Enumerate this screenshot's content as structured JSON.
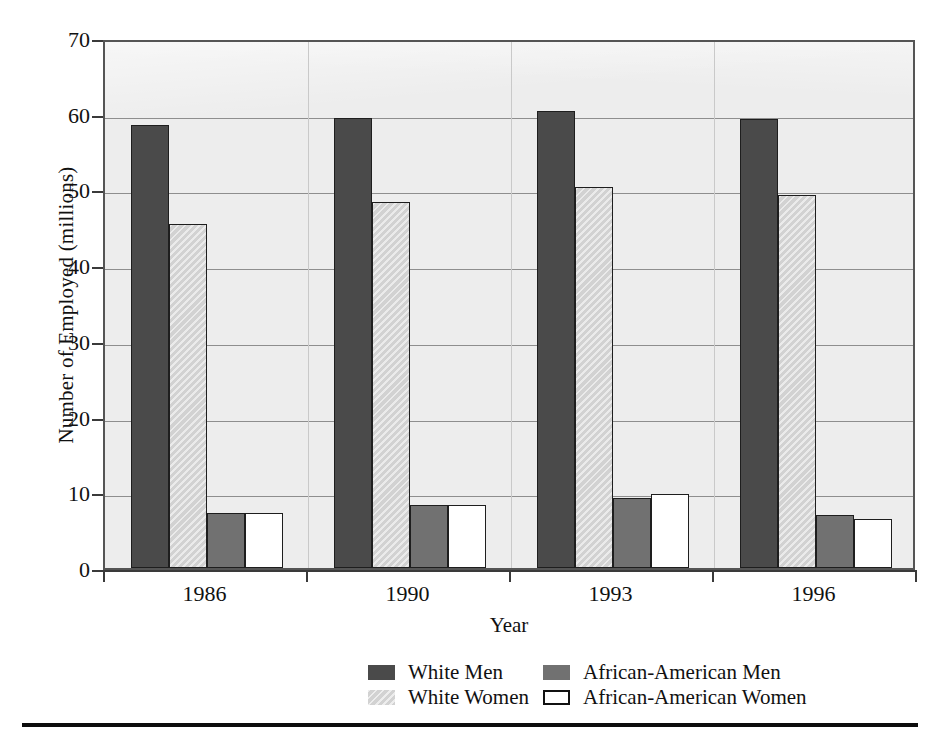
{
  "chart_data": {
    "type": "bar",
    "title": "",
    "xlabel": "Year",
    "ylabel": "Number of Employed (millions)",
    "categories": [
      "1986",
      "1990",
      "1993",
      "1996"
    ],
    "series": [
      {
        "name": "White Men",
        "color": "#4a4a4a",
        "values": [
          58.5,
          59.4,
          60.3,
          59.3
        ]
      },
      {
        "name": "White Women",
        "color": "#d2d2d2",
        "values": [
          45.4,
          48.4,
          50.3,
          49.3
        ]
      },
      {
        "name": "African-American Men",
        "color": "#717171",
        "values": [
          7.3,
          8.3,
          9.2,
          7.0
        ]
      },
      {
        "name": "African-American Women",
        "color": "#ffffff",
        "values": [
          7.3,
          8.3,
          9.8,
          6.5
        ]
      }
    ],
    "ylim": [
      0,
      70
    ],
    "yticks": [
      0,
      10,
      20,
      30,
      40,
      50,
      60,
      70
    ],
    "ytick_labels": [
      "0",
      "10",
      "20",
      "30",
      "40",
      "50",
      "60",
      "70"
    ],
    "grid": true,
    "legend_position": "bottom"
  }
}
